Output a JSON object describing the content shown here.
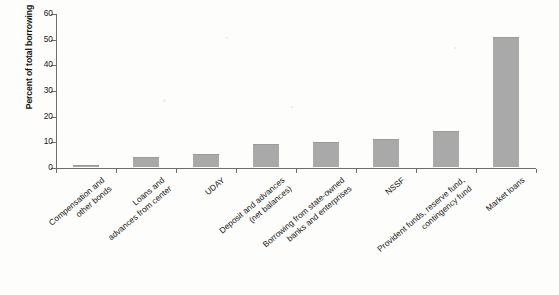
{
  "figure": {
    "title_partial": "Percent of total borrowing",
    "background_color": "#fdfdfb",
    "bar_color": "#a9a9a9",
    "axis_color": "#6d6d6d"
  },
  "chart_data": {
    "type": "bar",
    "title": "",
    "xlabel": "",
    "ylabel": "Percent of total borrowing",
    "ylim": [
      0,
      60
    ],
    "yticks": [
      0,
      10,
      20,
      30,
      40,
      50,
      60
    ],
    "ytick_labels": [
      "0",
      "10",
      "20",
      "30",
      "40",
      "50",
      "60"
    ],
    "grid": false,
    "legend": null,
    "orientation": "vertical",
    "categories": [
      "Compensation and\nother bonds",
      "Loans and\nadvances from center",
      "UDAY",
      "Deposit and advances\n(net balances)",
      "Borrowing from state-owned\nbanks and enterprises",
      "NSSF",
      "Provident funds, reserve fund,\ncontingency fund",
      "Market loans"
    ],
    "categories_flat": [
      "Compensation and other bonds",
      "Loans and advances from center",
      "UDAY",
      "Deposit and advances (net balances)",
      "Borrowing from state-owned banks and enterprises",
      "NSSF",
      "Provident funds, reserve fund, contingency fund",
      "Market loans"
    ],
    "values": [
      0.3,
      3.5,
      4.5,
      8.5,
      9.3,
      10.5,
      13.5,
      50.3
    ],
    "value_unit": "percent"
  }
}
